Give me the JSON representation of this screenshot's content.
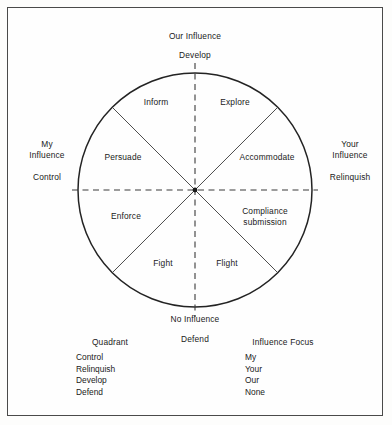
{
  "diagram": {
    "title_semantic": "influence-quadrant-wheel",
    "circle": {
      "center_x": 195,
      "center_y": 190,
      "radius": 117
    },
    "axes": {
      "top": {
        "primary": "Our Influence",
        "secondary": "Develop"
      },
      "bottom": {
        "primary": "No Influence",
        "secondary": "Defend"
      },
      "left": {
        "primary_line1": "My",
        "primary_line2": "Influence",
        "secondary": "Control"
      },
      "right": {
        "primary_line1": "Your",
        "primary_line2": "Influence",
        "secondary": "Relinquish"
      }
    },
    "sectors": [
      {
        "id": "inform",
        "label": "Inform"
      },
      {
        "id": "explore",
        "label": "Explore"
      },
      {
        "id": "persuade",
        "label": "Persuade"
      },
      {
        "id": "accommodate",
        "label": "Accommodate"
      },
      {
        "id": "enforce",
        "label": "Enforce"
      },
      {
        "id": "compliance",
        "label_line1": "Compliance",
        "label_line2": "submission"
      },
      {
        "id": "fight",
        "label": "Fight"
      },
      {
        "id": "flight",
        "label": "Flight"
      }
    ]
  },
  "legend": {
    "quadrant": {
      "heading": "Quadrant",
      "items": [
        "Control",
        "Relinquish",
        "Develop",
        "Defend"
      ]
    },
    "influence_focus": {
      "heading": "Influence Focus",
      "items": [
        "My",
        "Your",
        "Our",
        "None"
      ]
    }
  },
  "colors": {
    "ink": "#1a1a1a",
    "line": "#2b2b2b",
    "frame": "#4a4a4a",
    "paper": "#fefefe"
  }
}
